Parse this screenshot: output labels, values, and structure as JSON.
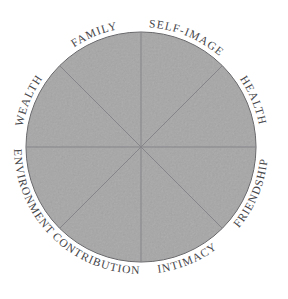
{
  "colors": {
    "background": "#ffffff",
    "wheel_fill": "#b4b4b5",
    "wheel_outline": "#606064",
    "spoke_line": "#85858a",
    "label_text": "#46464a"
  },
  "wheel": {
    "top_labels": [
      "WEALTH",
      "FAMILY",
      "SELF-IMAGE",
      "HEALTH"
    ],
    "bottom_labels": [
      "ENVIRONMENT",
      "CONTRIBUTION",
      "INTIMACY",
      "FRIENDSHIP"
    ]
  }
}
